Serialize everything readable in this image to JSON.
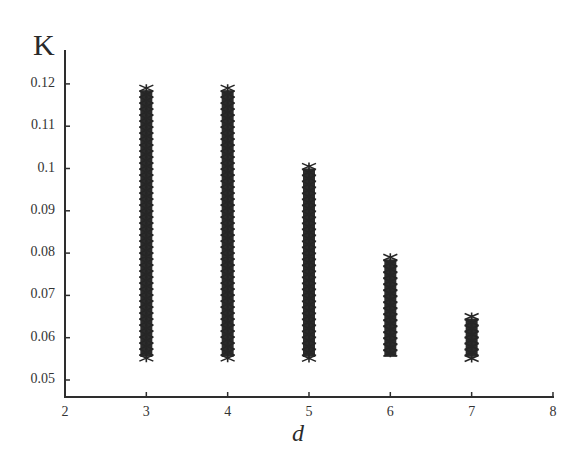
{
  "chart_data": {
    "type": "scatter",
    "title": "",
    "xlabel": "d",
    "ylabel": "K",
    "xlim": [
      2,
      8
    ],
    "ylim": [
      0.046,
      0.128
    ],
    "grid": false,
    "legend": null,
    "x_ticks": [
      "2",
      "3",
      "4",
      "5",
      "6",
      "7",
      "8"
    ],
    "y_ticks": [
      "0.05",
      "0.06",
      "0.07",
      "0.08",
      "0.09",
      "0.1",
      "0.11",
      "0.12"
    ],
    "marker": "asterisk, dense vertical stacks",
    "marker_color": "#2b2b2b",
    "series": [
      {
        "name": "K range per d",
        "x": [
          3,
          4,
          5,
          6,
          7
        ],
        "y_min": [
          0.055,
          0.055,
          0.055,
          0.055,
          0.055
        ],
        "y_max": [
          0.119,
          0.119,
          0.1005,
          0.079,
          0.065
        ]
      }
    ]
  },
  "labels": {
    "y_axis": "K",
    "x_axis": "d"
  },
  "ticks": {
    "y": [
      {
        "label": "0.12",
        "value": 0.12
      },
      {
        "label": "0.11",
        "value": 0.11
      },
      {
        "label": "0.1",
        "value": 0.1
      },
      {
        "label": "0.09",
        "value": 0.09
      },
      {
        "label": "0.08",
        "value": 0.08
      },
      {
        "label": "0.07",
        "value": 0.07
      },
      {
        "label": "0.06",
        "value": 0.06
      },
      {
        "label": "0.05",
        "value": 0.05
      }
    ],
    "x": [
      {
        "label": "2",
        "value": 2
      },
      {
        "label": "3",
        "value": 3
      },
      {
        "label": "4",
        "value": 4
      },
      {
        "label": "5",
        "value": 5
      },
      {
        "label": "6",
        "value": 6
      },
      {
        "label": "7",
        "value": 7
      },
      {
        "label": "8",
        "value": 8
      }
    ]
  },
  "colors": {
    "axis": "#2e2e2e",
    "marker": "#2b2b2b",
    "background": "#ffffff"
  }
}
